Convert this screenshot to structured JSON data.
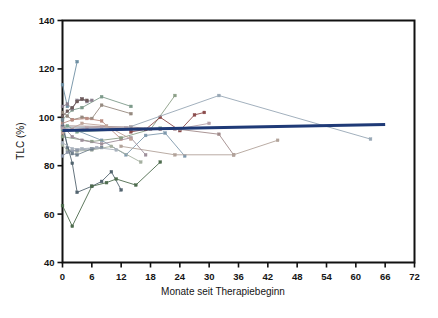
{
  "chart_data": {
    "type": "line",
    "title": "",
    "subtitle": "",
    "xlabel": "Monate seit Therapiebeginn",
    "ylabel": "TLC (%)",
    "xlim": [
      0,
      72
    ],
    "ylim": [
      40,
      140
    ],
    "xticks": [
      0,
      6,
      12,
      18,
      24,
      30,
      36,
      42,
      48,
      54,
      60,
      66,
      72
    ],
    "yticks": [
      40,
      60,
      80,
      100,
      120,
      140
    ],
    "xtick_labels": [
      "0",
      "6",
      "12",
      "18",
      "24",
      "30",
      "36",
      "42",
      "48",
      "54",
      "60",
      "66",
      "72"
    ],
    "ytick_labels": [
      "40",
      "60",
      "80",
      "100",
      "120",
      "140"
    ],
    "grid": false,
    "legend": null,
    "legend_position": "none",
    "marker": "small-square",
    "trend_line": {
      "name": "Regressionsgerade",
      "color": "#1f3a77",
      "width": 3,
      "x": [
        0,
        66
      ],
      "y": [
        94.5,
        97.0
      ]
    },
    "series": [
      {
        "name": "P01",
        "color": "#6e8fa3",
        "x": [
          0,
          1,
          3
        ],
        "y": [
          113.5,
          104.5,
          123.0
        ]
      },
      {
        "name": "P02",
        "color": "#7d9a8a",
        "x": [
          0,
          2,
          4,
          8,
          14
        ],
        "y": [
          99.0,
          103.0,
          104.0,
          108.5,
          104.5
        ]
      },
      {
        "name": "P03",
        "color": "#8a7f8e",
        "x": [
          0,
          1,
          2,
          3,
          4,
          5,
          6
        ],
        "y": [
          104.5,
          105.5,
          103.5,
          107.0,
          107.5,
          106.5,
          107.0
        ]
      },
      {
        "name": "P04",
        "color": "#6d5a5a",
        "x": [
          0,
          1,
          2,
          3,
          4,
          5
        ],
        "y": [
          100.5,
          102.5,
          104.0,
          106.5,
          107.5,
          107.0
        ]
      },
      {
        "name": "P05",
        "color": "#96897f",
        "x": [
          0,
          1,
          2,
          4,
          6,
          8,
          14
        ],
        "y": [
          102.0,
          100.5,
          99.0,
          100.0,
          99.5,
          105.0,
          101.5
        ]
      },
      {
        "name": "P06",
        "color": "#b98b80",
        "x": [
          0,
          2,
          5,
          8,
          12
        ],
        "y": [
          97.5,
          99.0,
          99.5,
          98.5,
          91.0
        ]
      },
      {
        "name": "P07",
        "color": "#7f99ad",
        "x": [
          0,
          3,
          8,
          13,
          17,
          21,
          25
        ],
        "y": [
          95.0,
          94.5,
          90.5,
          84.5,
          92.5,
          93.5,
          84.0
        ]
      },
      {
        "name": "P08",
        "color": "#8b9e86",
        "x": [
          0,
          6,
          12,
          18,
          23
        ],
        "y": [
          92.0,
          90.0,
          91.5,
          95.0,
          109.0
        ]
      },
      {
        "name": "P09",
        "color": "#8a4a4a",
        "x": [
          14,
          17,
          20,
          24,
          27,
          29
        ],
        "y": [
          94.0,
          95.0,
          100.0,
          94.5,
          101.0,
          102.0
        ]
      },
      {
        "name": "P10",
        "color": "#a08a8a",
        "x": [
          0,
          14,
          20,
          24,
          32,
          35
        ],
        "y": [
          96.5,
          96.0,
          95.0,
          95.0,
          93.0,
          84.5
        ]
      },
      {
        "name": "P11",
        "color": "#97a7b5",
        "x": [
          0,
          13,
          32,
          63
        ],
        "y": [
          96.0,
          95.5,
          109.0,
          91.0
        ]
      },
      {
        "name": "P12",
        "color": "#b2a39a",
        "x": [
          12,
          23,
          35,
          44
        ],
        "y": [
          88.0,
          84.5,
          84.5,
          90.5
        ]
      },
      {
        "name": "P13",
        "color": "#9e8f9b",
        "x": [
          0,
          2,
          4,
          8,
          14,
          17
        ],
        "y": [
          96.5,
          92.0,
          90.5,
          89.0,
          91.5,
          84.5
        ]
      },
      {
        "name": "P14",
        "color": "#a5b0a0",
        "x": [
          0,
          1,
          3,
          6,
          10,
          16
        ],
        "y": [
          88.5,
          86.5,
          86.0,
          86.5,
          88.0,
          81.5
        ]
      },
      {
        "name": "P15",
        "color": "#8d96a8",
        "x": [
          0,
          1,
          2,
          3,
          6
        ],
        "y": [
          84.0,
          85.5,
          86.0,
          86.5,
          87.0
        ]
      },
      {
        "name": "P16",
        "color": "#6f7f8c",
        "x": [
          0,
          1,
          2,
          3,
          6,
          8
        ],
        "y": [
          99.0,
          87.5,
          85.0,
          84.5,
          87.0,
          87.5
        ]
      },
      {
        "name": "P17",
        "color": "#53646f",
        "x": [
          0,
          2,
          3,
          6,
          8,
          10,
          12
        ],
        "y": [
          96.0,
          81.0,
          69.0,
          71.5,
          73.5,
          77.5,
          70.0
        ]
      },
      {
        "name": "P18",
        "color": "#4d6b4d",
        "x": [
          0,
          2,
          6,
          9,
          11,
          15,
          20
        ],
        "y": [
          63.5,
          55.0,
          71.5,
          73.0,
          74.5,
          72.0,
          81.5
        ]
      },
      {
        "name": "P19",
        "color": "#7fa38f",
        "x": [
          0,
          1,
          3,
          20
        ],
        "y": [
          95.0,
          96.5,
          94.0,
          95.5
        ]
      },
      {
        "name": "P20",
        "color": "#b6a0a8",
        "x": [
          0,
          2,
          5,
          8,
          13,
          18,
          23,
          30
        ],
        "y": [
          95.5,
          95.0,
          95.5,
          96.0,
          95.5,
          95.0,
          95.0,
          97.5
        ]
      },
      {
        "name": "P21",
        "color": "#a9b2bd",
        "x": [
          0,
          2,
          4,
          7,
          11
        ],
        "y": [
          89.5,
          87.0,
          87.0,
          87.5,
          86.5
        ]
      },
      {
        "name": "P22",
        "color": "#c0a59b",
        "x": [
          0,
          4,
          9,
          14
        ],
        "y": [
          93.5,
          97.5,
          96.5,
          91.0
        ]
      }
    ]
  },
  "axes": {
    "ylabel": "TLC (%)",
    "xlabel": "Monate seit Therapiebeginn"
  }
}
